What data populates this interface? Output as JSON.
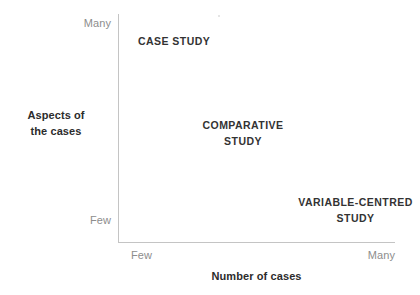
{
  "chart_data": {
    "type": "scatter",
    "title": "",
    "xlabel": "Number of cases",
    "ylabel": "Aspects of the cases",
    "grid": false,
    "legend": null,
    "x_axis": {
      "label": "Number of cases",
      "ticks": [
        "Few",
        "Many"
      ],
      "low_label": "Few",
      "high_label": "Many"
    },
    "y_axis": {
      "label_line1": "Aspects of",
      "label_line2": "the cases",
      "ticks": [
        "Few",
        "Many"
      ],
      "low_label": "Few",
      "high_label": "Many"
    },
    "annotations": [
      {
        "id": "case-study",
        "text": "CASE STUDY",
        "line1": "CASE STUDY",
        "line2": "",
        "x_position": "few",
        "y_position": "many",
        "align": "left"
      },
      {
        "id": "comparative-study",
        "text": "COMPARATIVE STUDY",
        "line1": "COMPARATIVE",
        "line2": "STUDY",
        "x_position": "medium",
        "y_position": "medium",
        "align": "center"
      },
      {
        "id": "variable-centred-study",
        "text": "VARIABLE-CENTRED STUDY",
        "line1": "VARIABLE-CENTRED",
        "line2": "STUDY",
        "x_position": "many",
        "y_position": "few",
        "align": "center"
      }
    ],
    "colors": {
      "axis_line": "#c4c4c4",
      "tick_text": "#8d8d8d",
      "axis_title_text": "#2c2c2c",
      "annotation_text": "#333333",
      "background": "#ffffff"
    }
  }
}
